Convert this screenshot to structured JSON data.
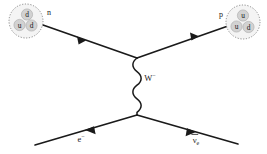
{
  "diagram": {
    "background_color": "#ffffff",
    "line_color": "#1a1a1a",
    "quark_fill_color": "#d2d2d2",
    "hadron_fill_color": "#f4f4f4",
    "hadron_border_color": "#8a8a8a"
  },
  "neutron": {
    "label": "n",
    "quarks": [
      {
        "name": "d"
      },
      {
        "name": "u"
      },
      {
        "name": "d"
      }
    ]
  },
  "proton": {
    "label": "p",
    "quarks": [
      {
        "name": "u"
      },
      {
        "name": "u"
      },
      {
        "name": "d"
      }
    ]
  },
  "boson": {
    "symbol": "W",
    "charge": "−"
  },
  "electron": {
    "symbol": "e",
    "charge": "−"
  },
  "antineutrino": {
    "symbol": "ν",
    "subscript": "e"
  }
}
